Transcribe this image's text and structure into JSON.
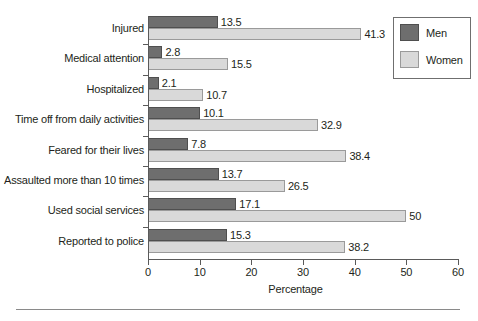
{
  "chart_data": {
    "type": "bar",
    "orientation": "horizontal",
    "title": "",
    "xlabel": "Percentage",
    "ylabel": "",
    "xlim": [
      0,
      60
    ],
    "xticks": [
      0,
      10,
      20,
      30,
      40,
      50,
      60
    ],
    "xtick_labels": [
      "0",
      "10",
      "20",
      "30",
      "40",
      "50",
      "60"
    ],
    "grid": false,
    "legend_position": "top-right",
    "categories": [
      "Injured",
      "Medical attention",
      "Hospitalized",
      "Time off from daily activities",
      "Feared for their lives",
      "Assaulted more than 10 times",
      "Used social services",
      "Reported to police"
    ],
    "series": [
      {
        "name": "Men",
        "color": "#6e6e6e",
        "values": [
          13.5,
          2.8,
          2.1,
          10.1,
          7.8,
          13.7,
          17.1,
          15.3
        ],
        "value_labels": [
          "13.5",
          "2.8",
          "2.1",
          "10.1",
          "7.8",
          "13.7",
          "17.1",
          "15.3"
        ]
      },
      {
        "name": "Women",
        "color": "#d9d9d9",
        "values": [
          41.3,
          15.5,
          10.7,
          32.9,
          38.4,
          26.5,
          50,
          38.2
        ],
        "value_labels": [
          "41.3",
          "15.5",
          "10.7",
          "32.9",
          "38.4",
          "26.5",
          "50",
          "38.2"
        ]
      }
    ]
  },
  "legend": {
    "items": [
      {
        "label": "Men",
        "color": "#6e6e6e"
      },
      {
        "label": "Women",
        "color": "#d9d9d9"
      }
    ]
  }
}
